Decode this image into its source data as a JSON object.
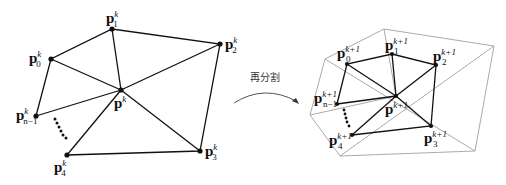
{
  "caption": "再分割",
  "left_mesh": {
    "center": {
      "base": "p",
      "sup": "k",
      "sub": ""
    },
    "vertices": [
      {
        "id": "p0",
        "base": "p",
        "sup": "k",
        "sub": "0"
      },
      {
        "id": "p1",
        "base": "p",
        "sup": "k",
        "sub": "1"
      },
      {
        "id": "p2",
        "base": "p",
        "sup": "k",
        "sub": "2"
      },
      {
        "id": "p3",
        "base": "p",
        "sup": "k",
        "sub": "3"
      },
      {
        "id": "p4",
        "base": "p",
        "sup": "k",
        "sub": "4"
      },
      {
        "id": "pn1",
        "base": "p",
        "sup": "k",
        "sub": "n−1"
      }
    ]
  },
  "right_mesh": {
    "center": {
      "base": "p",
      "sup": "k+1",
      "sub": ""
    },
    "vertices": [
      {
        "id": "p0",
        "base": "p",
        "sup": "k+1",
        "sub": "0"
      },
      {
        "id": "p1",
        "base": "p",
        "sup": "k+1",
        "sub": "1"
      },
      {
        "id": "p2",
        "base": "p",
        "sup": "k+1",
        "sub": "2"
      },
      {
        "id": "p3",
        "base": "p",
        "sup": "k+1",
        "sub": "3"
      },
      {
        "id": "p4",
        "base": "p",
        "sup": "k+1",
        "sub": "4"
      },
      {
        "id": "pn1",
        "base": "p",
        "sup": "k+1",
        "sub": "n−1"
      }
    ]
  },
  "ellipsis": "....."
}
